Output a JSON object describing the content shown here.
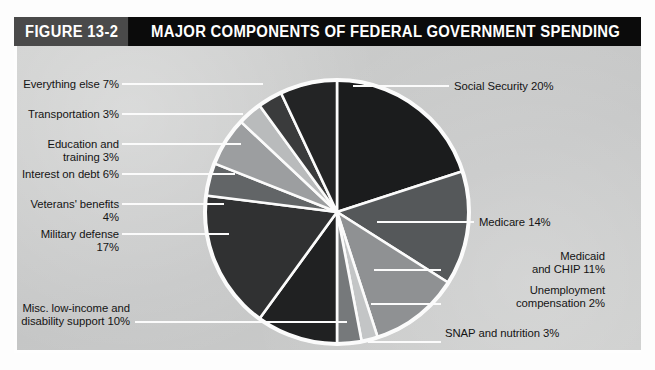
{
  "figure": {
    "badge": "FIGURE 13-2",
    "title": "MAJOR COMPONENTS OF FEDERAL GOVERNMENT SPENDING"
  },
  "colors": {
    "title_bar_bg": "#0b0b0b",
    "badge_bg": "#4a4a4a",
    "panel_bg": "#c8c9c9",
    "slice_separator": "#fbfbfb",
    "pie_outline": "#fbfbfb",
    "label_text": "#141414"
  },
  "chart_data": {
    "type": "pie",
    "title": "MAJOR COMPONENTS OF FEDERAL GOVERNMENT SPENDING",
    "xlabel": "",
    "ylabel": "",
    "units": "percent",
    "total": 100,
    "legend_position": "callout-labels",
    "grid": false,
    "start_angle_deg": -90,
    "direction": "clockwise",
    "categories": [
      "Social Security",
      "Medicare",
      "Medicaid and CHIP",
      "Unemployment compensation",
      "SNAP and nutrition",
      "Misc. low-income and disability support",
      "Military defense",
      "Veterans' benefits",
      "Interest on debt",
      "Education and training",
      "Transportation",
      "Everything else"
    ],
    "values": [
      20,
      14,
      11,
      2,
      3,
      10,
      17,
      4,
      6,
      3,
      3,
      7
    ],
    "slice_colors": [
      "#1b1c1d",
      "#55585a",
      "#8f9193",
      "#c3c5c6",
      "#76797b",
      "#202122",
      "#303132",
      "#626567",
      "#9c9ea0",
      "#b9bbbc",
      "#3a3b3c",
      "#232425"
    ],
    "slices": [
      {
        "label": "Social Security 20%",
        "name": "Social Security",
        "value": 20
      },
      {
        "label": "Medicare 14%",
        "name": "Medicare",
        "value": 14
      },
      {
        "label": "Medicaid\nand CHIP 11%",
        "name": "Medicaid and CHIP",
        "value": 11
      },
      {
        "label": "Unemployment\ncompensation 2%",
        "name": "Unemployment compensation",
        "value": 2
      },
      {
        "label": "SNAP and nutrition 3%",
        "name": "SNAP and nutrition",
        "value": 3
      },
      {
        "label": "Misc. low-income and\ndisability support 10%",
        "name": "Misc. low-income and disability support",
        "value": 10
      },
      {
        "label": "Military defense 17%",
        "name": "Military defense",
        "value": 17
      },
      {
        "label": "Veterans' benefits 4%",
        "name": "Veterans' benefits",
        "value": 4
      },
      {
        "label": "Interest on debt 6%",
        "name": "Interest on debt",
        "value": 6
      },
      {
        "label": "Education and training 3%",
        "name": "Education and training",
        "value": 3
      },
      {
        "label": "Transportation 3%",
        "name": "Transportation",
        "value": 3
      },
      {
        "label": "Everything else 7%",
        "name": "Everything else",
        "value": 7
      }
    ]
  },
  "labels": {
    "social_security": "Social Security 20%",
    "medicare": "Medicare 14%",
    "medicaid_chip": "Medicaid\nand CHIP 11%",
    "unemployment": "Unemployment\ncompensation 2%",
    "snap": "SNAP and nutrition 3%",
    "misc_low_income": "Misc. low-income and\ndisability support 10%",
    "military_defense": "Military defense 17%",
    "veterans_benefits": "Veterans' benefits 4%",
    "interest_on_debt": "Interest on debt 6%",
    "education_training": "Education and training 3%",
    "transportation": "Transportation 3%",
    "everything_else": "Everything else 7%"
  }
}
